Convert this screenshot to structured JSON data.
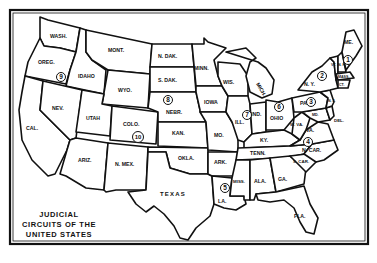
{
  "title": {
    "line1": "JUDICIAL",
    "line2": "CIRCUITS OF THE",
    "line3": "UNITED STATES"
  },
  "states": [
    {
      "id": "wa",
      "label": "WASH."
    },
    {
      "id": "or",
      "label": "OREG."
    },
    {
      "id": "ca",
      "label": "CAL."
    },
    {
      "id": "id",
      "label": "IDAHO"
    },
    {
      "id": "nv",
      "label": "NEV."
    },
    {
      "id": "mt",
      "label": "MONT."
    },
    {
      "id": "wy",
      "label": "WYO."
    },
    {
      "id": "ut",
      "label": "UTAH"
    },
    {
      "id": "az",
      "label": "ARIZ."
    },
    {
      "id": "co",
      "label": "COLO."
    },
    {
      "id": "nm",
      "label": "N. MEX."
    },
    {
      "id": "nd",
      "label": "N. DAK."
    },
    {
      "id": "sd",
      "label": "S. DAK."
    },
    {
      "id": "ne",
      "label": "NEBR."
    },
    {
      "id": "ks",
      "label": "KAN."
    },
    {
      "id": "ok",
      "label": "OKLA."
    },
    {
      "id": "tx",
      "label": "TEXAS"
    },
    {
      "id": "mn",
      "label": "MINN."
    },
    {
      "id": "ia",
      "label": "IOWA"
    },
    {
      "id": "mo",
      "label": "MO."
    },
    {
      "id": "ar",
      "label": "ARK."
    },
    {
      "id": "la",
      "label": "LA."
    },
    {
      "id": "wi",
      "label": "WIS."
    },
    {
      "id": "mi",
      "label": "MICH."
    },
    {
      "id": "il",
      "label": "ILL."
    },
    {
      "id": "in",
      "label": "IND."
    },
    {
      "id": "oh",
      "label": "OHIO"
    },
    {
      "id": "ky",
      "label": "KY."
    },
    {
      "id": "tn",
      "label": "TENN."
    },
    {
      "id": "ms",
      "label": "MISS."
    },
    {
      "id": "al",
      "label": "ALA."
    },
    {
      "id": "ga",
      "label": "GA."
    },
    {
      "id": "fl",
      "label": "FLA."
    },
    {
      "id": "sc",
      "label": "S. CAR."
    },
    {
      "id": "nc",
      "label": "N. CAR."
    },
    {
      "id": "va",
      "label": "VA."
    },
    {
      "id": "wv",
      "label": "W. VA."
    },
    {
      "id": "pa",
      "label": "PA."
    },
    {
      "id": "ny",
      "label": "N. Y."
    },
    {
      "id": "me",
      "label": "ME."
    },
    {
      "id": "vt",
      "label": "VT."
    },
    {
      "id": "nh",
      "label": "N. H."
    },
    {
      "id": "ma",
      "label": "MASS."
    },
    {
      "id": "ct",
      "label": "CT."
    },
    {
      "id": "nj",
      "label": "N. J."
    },
    {
      "id": "md",
      "label": "MD."
    },
    {
      "id": "de",
      "label": "DEL."
    }
  ],
  "circuits": [
    {
      "number": "1"
    },
    {
      "number": "2"
    },
    {
      "number": "3"
    },
    {
      "number": "4"
    },
    {
      "number": "5"
    },
    {
      "number": "6"
    },
    {
      "number": "7"
    },
    {
      "number": "8"
    },
    {
      "number": "9"
    },
    {
      "number": "10"
    }
  ]
}
